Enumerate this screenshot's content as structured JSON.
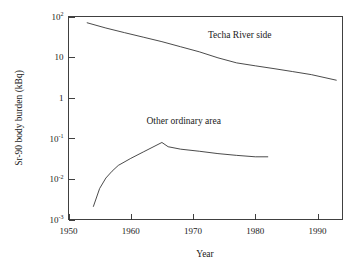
{
  "chart_data": {
    "type": "line",
    "title": "",
    "xlabel": "Year",
    "ylabel": "Sr-90 body burden (kBq)",
    "yscale": "log",
    "xlim": [
      1950,
      1994
    ],
    "ylim": [
      0.001,
      100
    ],
    "grid": false,
    "legend_position": "inline-annotation",
    "xticks": [
      1950,
      1960,
      1970,
      1980,
      1990
    ],
    "xtick_labels": [
      "1950",
      "1960",
      "1970",
      "1980",
      "1990"
    ],
    "yticks": [
      100,
      10,
      1,
      0.1,
      0.01,
      0.001
    ],
    "ytick_labels": [
      {
        "mantissa": "10",
        "exponent": "2"
      },
      {
        "mantissa": "10",
        "exponent": ""
      },
      {
        "mantissa": "1",
        "exponent": ""
      },
      {
        "mantissa": "10",
        "exponent": "-1"
      },
      {
        "mantissa": "10",
        "exponent": "-2"
      },
      {
        "mantissa": "10",
        "exponent": "-3"
      }
    ],
    "series": [
      {
        "name": "Techa River side",
        "label": "Techa River side",
        "label_x": 1977.5,
        "label_y": 30,
        "x": [
          1953,
          1956,
          1959,
          1962,
          1965,
          1968,
          1971,
          1974,
          1977,
          1980,
          1983,
          1986,
          1989,
          1993
        ],
        "y": [
          70,
          52,
          40,
          31,
          24,
          18,
          13.5,
          9.6,
          7.2,
          6.1,
          5.2,
          4.4,
          3.7,
          2.7
        ]
      },
      {
        "name": "Other ordinary area",
        "label": "Other ordinary area",
        "label_x": 1968.5,
        "label_y": 0.22,
        "x": [
          1954,
          1955,
          1956,
          1957,
          1958,
          1960,
          1962,
          1965,
          1966,
          1968,
          1971,
          1974,
          1977,
          1980,
          1982
        ],
        "y": [
          0.0021,
          0.0058,
          0.0105,
          0.0155,
          0.0215,
          0.032,
          0.046,
          0.079,
          0.062,
          0.054,
          0.048,
          0.042,
          0.038,
          0.035,
          0.035
        ]
      }
    ]
  },
  "axes": {
    "x_title": "Year",
    "y_title": "Sr-90 body burden (kBq)"
  }
}
